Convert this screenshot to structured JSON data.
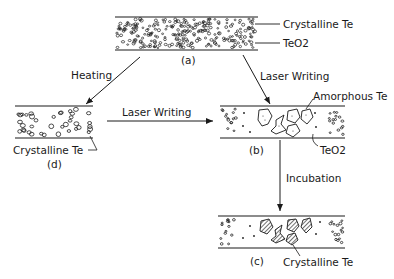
{
  "diagram": {
    "panels": {
      "a": {
        "id_label": "(a)",
        "annotations": [
          "Crystalline Te",
          "TeO2"
        ]
      },
      "b": {
        "id_label": "(b)",
        "annotations": [
          "Amorphous Te",
          "TeO2"
        ]
      },
      "c": {
        "id_label": "(c)",
        "annotations": [
          "Crystalline Te"
        ]
      },
      "d": {
        "id_label": "(d)",
        "annotations": [
          "Crystalline Te"
        ]
      }
    },
    "arrows": {
      "a_to_d": "Heating",
      "a_to_b": "Laser Writing",
      "d_to_b": "Laser Writing",
      "b_to_c": "Incubation"
    },
    "colors": {
      "ink": "#1a1a1a",
      "background": "#ffffff",
      "hatch": "#555555"
    }
  }
}
